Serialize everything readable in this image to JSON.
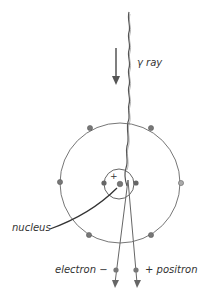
{
  "diagram": {
    "labels": {
      "gamma": "γ ray",
      "nucleus": "nucleus",
      "electron": "electron −",
      "positron": "+ positron",
      "nucleus_charge": "+"
    },
    "colors": {
      "line": "#555555",
      "particle": "#777777",
      "text": "#333333"
    }
  }
}
